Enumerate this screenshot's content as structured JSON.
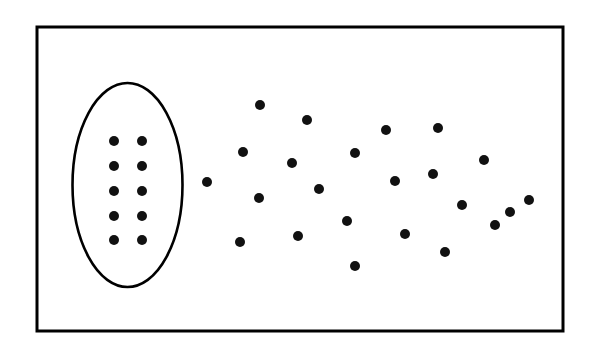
{
  "figure": {
    "name": "ordered-vs-disordered-particle-diagram",
    "background_color": "#ffffff",
    "ink_color": "#000000",
    "width": 592,
    "height": 362
  },
  "frame": {
    "label": "outer-rectangle-border",
    "x": 37,
    "y": 27,
    "width": 526,
    "height": 304,
    "stroke_width": 3,
    "stroke_color": "#000000",
    "fill": "none"
  },
  "cluster_boundary": {
    "label": "ellipse-enclosing-ordered-region",
    "cx": 127.5,
    "cy": 185,
    "rx": 55,
    "ry": 102,
    "stroke_width": 2.6,
    "stroke_color": "#000000",
    "fill": "none"
  },
  "chart_data": {
    "type": "scatter",
    "title": "",
    "subtitle": "",
    "xlabel": "",
    "ylabel": "",
    "xlim": [
      37,
      563
    ],
    "ylim": [
      27,
      331
    ],
    "grid": false,
    "legend": null,
    "annotations": [],
    "dot_radius": 5,
    "dot_color": "#111111",
    "series": [
      {
        "name": "ordered-grid-inside-ellipse",
        "description": "2 columns by 5 rows regular lattice of dots enclosed by the ellipse",
        "columns": 2,
        "rows": 5,
        "count": 10,
        "points": [
          {
            "x": 114,
            "y": 141
          },
          {
            "x": 142,
            "y": 141
          },
          {
            "x": 114,
            "y": 166
          },
          {
            "x": 142,
            "y": 166
          },
          {
            "x": 114,
            "y": 191
          },
          {
            "x": 142,
            "y": 191
          },
          {
            "x": 114,
            "y": 216
          },
          {
            "x": 142,
            "y": 216
          },
          {
            "x": 114,
            "y": 240
          },
          {
            "x": 142,
            "y": 240
          }
        ]
      },
      {
        "name": "disordered-scatter-outside-ellipse",
        "description": "Randomly scattered dots filling the region to the right of the ellipse",
        "count": 23,
        "points": [
          {
            "x": 207,
            "y": 182
          },
          {
            "x": 260,
            "y": 105
          },
          {
            "x": 307,
            "y": 120
          },
          {
            "x": 243,
            "y": 152
          },
          {
            "x": 292,
            "y": 163
          },
          {
            "x": 355,
            "y": 153
          },
          {
            "x": 259,
            "y": 198
          },
          {
            "x": 319,
            "y": 189
          },
          {
            "x": 347,
            "y": 221
          },
          {
            "x": 298,
            "y": 236
          },
          {
            "x": 240,
            "y": 242
          },
          {
            "x": 355,
            "y": 266
          },
          {
            "x": 386,
            "y": 130
          },
          {
            "x": 438,
            "y": 128
          },
          {
            "x": 395,
            "y": 181
          },
          {
            "x": 433,
            "y": 174
          },
          {
            "x": 484,
            "y": 160
          },
          {
            "x": 462,
            "y": 205
          },
          {
            "x": 405,
            "y": 234
          },
          {
            "x": 445,
            "y": 252
          },
          {
            "x": 495,
            "y": 225
          },
          {
            "x": 529,
            "y": 200
          },
          {
            "x": 510,
            "y": 212
          }
        ]
      }
    ]
  }
}
